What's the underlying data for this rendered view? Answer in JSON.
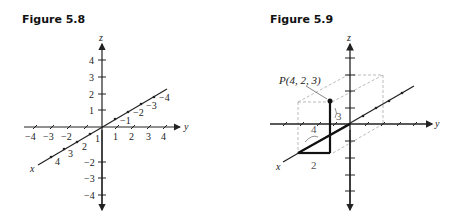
{
  "figures": [
    {
      "title": "Figure 5.8",
      "axes": {
        "x_label": "x",
        "y_label": "y",
        "z_label": "z"
      },
      "z_ticks_pos": [
        "4",
        "3",
        "2",
        "1"
      ],
      "z_ticks_neg": [
        "−2",
        "−3",
        "−4"
      ],
      "y_ticks_pos": [
        "1",
        "2",
        "3",
        "4"
      ],
      "y_ticks_neg": [
        "−4",
        "−3",
        "−2"
      ],
      "x_ticks_pos": [
        "1",
        "2",
        "3",
        "4"
      ],
      "x_ticks_neg": [
        "−1",
        "−2",
        "−3",
        "−4"
      ]
    },
    {
      "title": "Figure 5.9",
      "axes": {
        "x_label": "x",
        "y_label": "y",
        "z_label": "z"
      },
      "point_label": "P(4, 2, 3)",
      "segment_labels": {
        "x_length": "4",
        "y_length": "2",
        "z_length": "3"
      }
    }
  ]
}
